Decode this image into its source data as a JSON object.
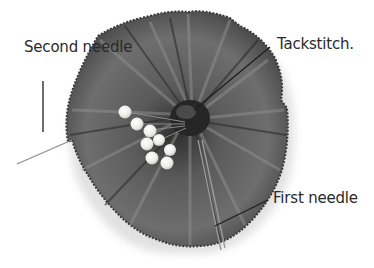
{
  "figure": {
    "type": "annotated-photo",
    "palette": {
      "background": "#ffffff",
      "fabric_dark": "#3e3e3e",
      "fabric_mid": "#6a6a6a",
      "fabric_light": "#9a9a9a",
      "pin_head": "#f2f2ee",
      "leader_line": "#1e1e1e",
      "label_text": "#2a2a2a"
    }
  },
  "labels": {
    "second_needle": "Second needle",
    "tackstitch": "Tackstitch.",
    "first_needle": "First needle"
  }
}
